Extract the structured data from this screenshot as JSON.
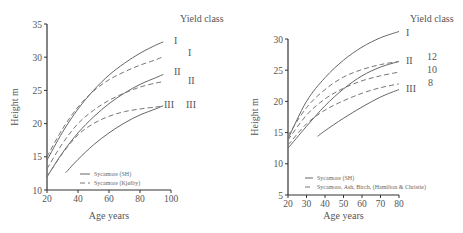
{
  "chart_data": [
    {
      "type": "line",
      "title": "",
      "xlabel": "Age years",
      "ylabel": "Height m",
      "xlim": [
        20,
        100
      ],
      "ylim": [
        10,
        35
      ],
      "xticks": [
        20,
        40,
        60,
        80,
        100
      ],
      "yticks": [
        10,
        15,
        20,
        25,
        30,
        35
      ],
      "grid": false,
      "yield_class_header": "Yield class",
      "legend": [
        {
          "label": "Sycamore (SH)",
          "style": "solid"
        },
        {
          "label": "Sycamore  (Kjølby)",
          "style": "dashed"
        }
      ],
      "series": [
        {
          "name": "Sycamore (SH) I",
          "style": "solid",
          "end_label": "I",
          "x": [
            20,
            30,
            40,
            50,
            60,
            70,
            80,
            90,
            95
          ],
          "y": [
            14.5,
            18.7,
            22.2,
            25.0,
            27.3,
            29.1,
            30.6,
            31.8,
            32.3
          ]
        },
        {
          "name": "Sycamore (SH) II",
          "style": "solid",
          "end_label": "II",
          "x": [
            20,
            30,
            40,
            50,
            60,
            70,
            80,
            90,
            95
          ],
          "y": [
            12.0,
            15.6,
            18.6,
            21.0,
            23.0,
            24.6,
            25.9,
            26.9,
            27.4
          ]
        },
        {
          "name": "Sycamore (SH) III",
          "style": "solid",
          "end_label": "III",
          "x": [
            32,
            40,
            50,
            60,
            70,
            80,
            90,
            95
          ],
          "y": [
            12.6,
            14.6,
            16.8,
            18.6,
            20.1,
            21.3,
            22.2,
            22.7
          ]
        },
        {
          "name": "Sycamore (Kjølby) I",
          "style": "dashed",
          "end_label": "I",
          "x": [
            20,
            30,
            40,
            50,
            60,
            70,
            80,
            90,
            95
          ],
          "y": [
            15.0,
            19.2,
            22.5,
            24.9,
            26.6,
            27.8,
            28.8,
            29.6,
            30.1
          ]
        },
        {
          "name": "Sycamore (Kjølby) II",
          "style": "dashed",
          "end_label": "II",
          "x": [
            20,
            30,
            40,
            50,
            60,
            70,
            80,
            90,
            95
          ],
          "y": [
            13.2,
            17.0,
            20.0,
            22.0,
            23.5,
            24.6,
            25.5,
            26.1,
            26.3
          ]
        },
        {
          "name": "Sycamore (Kjølby) III",
          "style": "dashed",
          "end_label": "III",
          "x": [
            20,
            30,
            40,
            50,
            60,
            70,
            80,
            90,
            95
          ],
          "y": [
            12.0,
            15.5,
            18.3,
            20.0,
            21.1,
            21.8,
            22.2,
            22.5,
            22.6
          ]
        }
      ]
    },
    {
      "type": "line",
      "title": "",
      "xlabel": "Age years",
      "ylabel": "Height m",
      "xlim": [
        20,
        80
      ],
      "ylim": [
        5,
        30
      ],
      "xticks": [
        20,
        30,
        40,
        50,
        60,
        70,
        80
      ],
      "yticks": [
        5,
        10,
        15,
        20,
        25,
        30
      ],
      "grid": false,
      "yield_class_header": "Yield class",
      "legend": [
        {
          "label": "Sycamore (SH)",
          "style": "solid"
        },
        {
          "label": "Sycamore, Ash, Birch, (Hamilton & Christie)",
          "style": "dashed"
        }
      ],
      "series": [
        {
          "name": "Sycamore (SH) I",
          "style": "solid",
          "end_label": "I",
          "x": [
            20,
            30,
            40,
            50,
            60,
            70,
            80
          ],
          "y": [
            14.0,
            20.0,
            23.8,
            26.6,
            28.7,
            30.2,
            31.2
          ]
        },
        {
          "name": "Sycamore (SH) II",
          "style": "solid",
          "end_label": "II",
          "x": [
            20,
            30,
            40,
            50,
            60,
            70,
            80
          ],
          "y": [
            12.5,
            16.0,
            19.3,
            22.0,
            24.1,
            25.5,
            26.4
          ]
        },
        {
          "name": "Sycamore (SH) III",
          "style": "solid",
          "end_label": "III",
          "x": [
            36,
            40,
            50,
            60,
            70,
            80
          ],
          "y": [
            14.4,
            15.3,
            17.3,
            19.1,
            20.7,
            21.9
          ]
        },
        {
          "name": "Hamilton & Christie YC 12",
          "style": "dashed",
          "end_label": "12",
          "x": [
            20,
            30,
            40,
            50,
            60,
            70,
            80
          ],
          "y": [
            14.5,
            19.0,
            21.9,
            23.9,
            25.1,
            25.9,
            26.4
          ]
        },
        {
          "name": "Hamilton & Christie YC 10",
          "style": "dashed",
          "end_label": "10",
          "x": [
            20,
            30,
            40,
            50,
            60,
            70,
            80
          ],
          "y": [
            13.8,
            17.8,
            20.4,
            22.1,
            23.3,
            24.1,
            24.7
          ]
        },
        {
          "name": "Hamilton & Christie YC 8",
          "style": "dashed",
          "end_label": "8",
          "x": [
            20,
            30,
            40,
            50,
            60,
            70,
            80
          ],
          "y": [
            13.0,
            16.4,
            18.6,
            20.1,
            21.3,
            22.2,
            22.8
          ]
        }
      ]
    }
  ]
}
